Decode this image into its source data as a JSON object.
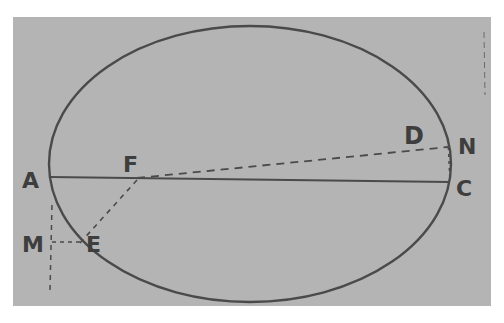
{
  "figure": {
    "background_color": "#b4b4b4",
    "ink_color": "#4a4a4a",
    "labels": {
      "A": "A",
      "F": "F",
      "D": "D",
      "N": "N",
      "C": "C",
      "M": "M",
      "E": "Ε"
    }
  }
}
